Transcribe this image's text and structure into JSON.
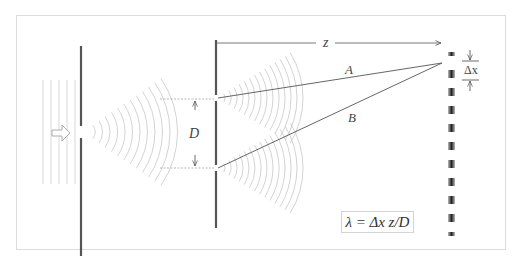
{
  "figure": {
    "labels": {
      "z": "z",
      "ray_a": "A",
      "ray_b": "B",
      "slit_separation": "D",
      "fringe_spacing": "Δx"
    },
    "formula": "λ = Δx z/D",
    "elements": [
      "incident-plane-waves",
      "source-arrow",
      "single-slit-wall",
      "double-slit-wall",
      "circular-wavefronts",
      "ray-A",
      "ray-B",
      "interference-screen"
    ],
    "fringe_count": 11,
    "colors": {
      "wall": "#555555",
      "wavefront": "#c8c8c8",
      "ray": "#555555",
      "frame": "#dcdcdc",
      "fringe_dark": "#222222"
    }
  }
}
